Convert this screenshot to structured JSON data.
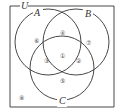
{
  "diagram": {
    "type": "venn",
    "universal_label": "U",
    "sets": [
      {
        "label": "A",
        "cx": 48,
        "cy": 42,
        "r": 33
      },
      {
        "label": "B",
        "cx": 76,
        "cy": 42,
        "r": 33
      },
      {
        "label": "C",
        "cx": 62,
        "cy": 68,
        "r": 32
      }
    ],
    "regions": [
      {
        "name": "A only",
        "label": "⑥",
        "x": 36,
        "y": 41
      },
      {
        "name": "A∩B only",
        "label": "④",
        "x": 62,
        "y": 33
      },
      {
        "name": "B only",
        "label": "⑦",
        "x": 88,
        "y": 43
      },
      {
        "name": "A∩C only",
        "label": "③",
        "x": 46,
        "y": 61
      },
      {
        "name": "A∩B∩C",
        "label": "①",
        "x": 62,
        "y": 56
      },
      {
        "name": "B∩C only",
        "label": "②",
        "x": 78,
        "y": 61
      },
      {
        "name": "C only",
        "label": "⑤",
        "x": 62,
        "y": 81
      },
      {
        "name": "outside",
        "label": "⑧",
        "x": 21,
        "y": 98
      }
    ],
    "colors": {
      "stroke": "#333333",
      "text": "#444444",
      "background": "#ffffff"
    }
  }
}
